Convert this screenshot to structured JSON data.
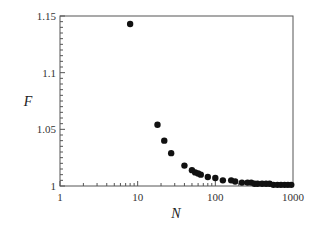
{
  "chart_data": {
    "type": "scatter",
    "title": "",
    "xlabel": "N",
    "ylabel": "F",
    "xscale": "log",
    "xlim": [
      1,
      1000
    ],
    "ylim": [
      1,
      1.15
    ],
    "grid": false,
    "legend": null,
    "x_ticks": [
      "1",
      "10",
      "100",
      "1000"
    ],
    "y_ticks": [
      "1",
      "1.05",
      "1.1",
      "1.15"
    ],
    "series": [
      {
        "name": "F(N)",
        "marker": "filled-circle",
        "color": "#111111",
        "points": [
          [
            8,
            1.143
          ],
          [
            18,
            1.054
          ],
          [
            22,
            1.04
          ],
          [
            27,
            1.029
          ],
          [
            40,
            1.018
          ],
          [
            50,
            1.014
          ],
          [
            55,
            1.012
          ],
          [
            60,
            1.011
          ],
          [
            65,
            1.01
          ],
          [
            80,
            1.008
          ],
          [
            100,
            1.007
          ],
          [
            125,
            1.005
          ],
          [
            160,
            1.005
          ],
          [
            180,
            1.004
          ],
          [
            220,
            1.003
          ],
          [
            260,
            1.003
          ],
          [
            290,
            1.003
          ],
          [
            320,
            1.002
          ],
          [
            350,
            1.002
          ],
          [
            400,
            1.002
          ],
          [
            450,
            1.002
          ],
          [
            500,
            1.002
          ],
          [
            560,
            1.001
          ],
          [
            630,
            1.001
          ],
          [
            700,
            1.001
          ],
          [
            780,
            1.001
          ],
          [
            860,
            1.001
          ],
          [
            950,
            1.001
          ]
        ]
      }
    ]
  }
}
